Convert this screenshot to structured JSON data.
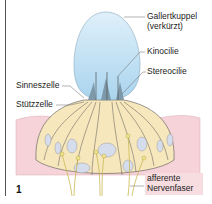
{
  "figure": {
    "number": "1",
    "labels": {
      "gallertkuppel_line1": "Gallertkuppel",
      "gallertkuppel_line2": "(verkürzt)",
      "kinocilie": "Kinocilie",
      "stereocilie": "Stereocilie",
      "sinneszelle": "Sinneszelle",
      "stuetzzelle": "Stützzelle",
      "nerv_line1": "afferente",
      "nerv_line2": "Nervenfaser"
    },
    "colors": {
      "cupula": "#c8e4f4",
      "epithelium": "#f7e7bc",
      "connective": "#f5d3d8",
      "nucleus": "#d5dcec",
      "nerve": "#f0e48c",
      "outline": "#555555"
    }
  }
}
